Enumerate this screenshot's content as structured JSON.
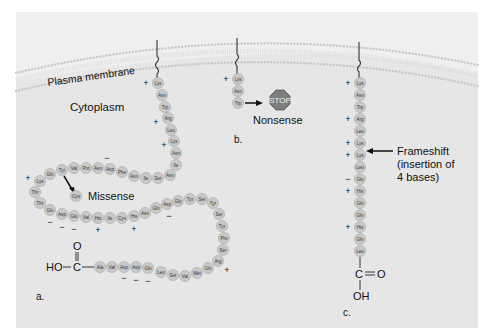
{
  "labels": {
    "membrane": "Plasma membrane",
    "cytoplasm": "Cytoplasm",
    "missense": "Missense",
    "nonsense": "Nonsense",
    "stop": "STOP",
    "frameshift_line1": "Frameshift",
    "frameshift_line2": "(insertion of",
    "frameshift_line3": "4 bases)",
    "panel_a": "a.",
    "panel_b": "b.",
    "panel_c": "c."
  },
  "chemistry": {
    "a_HO": "HO",
    "a_C": "C",
    "a_O": "O",
    "c_C": "C",
    "c_O": "O",
    "c_OH": "OH"
  },
  "colors": {
    "panel": "#e6e6e6",
    "amino_acid": "#c8c8c8",
    "stop_sign": "#7d7d7d"
  },
  "panel_a": {
    "residues": [
      {
        "aa": "Lys",
        "x": 158,
        "y": 83,
        "charge": "+",
        "cx": 146,
        "cy": 83
      },
      {
        "aa": "Asn",
        "x": 162,
        "y": 95
      },
      {
        "aa": "Trp",
        "x": 165,
        "y": 107
      },
      {
        "aa": "Arg",
        "x": 168,
        "y": 118,
        "charge": "+",
        "cx": 156,
        "cy": 122
      },
      {
        "aa": "Leu",
        "x": 171,
        "y": 130
      },
      {
        "aa": "Lys",
        "x": 174,
        "y": 141,
        "charge": "+",
        "cx": 164,
        "cy": 145
      },
      {
        "aa": "Asn",
        "x": 176,
        "y": 153
      },
      {
        "aa": "Ile",
        "x": 176,
        "y": 165
      },
      {
        "aa": "Asn",
        "x": 170,
        "y": 175
      },
      {
        "aa": "Ser",
        "x": 158,
        "y": 178
      },
      {
        "aa": "Ile",
        "x": 146,
        "y": 178
      },
      {
        "aa": "Asn",
        "x": 134,
        "y": 176
      },
      {
        "aa": "Phe",
        "x": 122,
        "y": 172
      },
      {
        "aa": "Asp",
        "x": 110,
        "y": 169,
        "charge": "−",
        "cx": 107,
        "cy": 158
      },
      {
        "aa": "Asn",
        "x": 98,
        "y": 168
      },
      {
        "aa": "Pro",
        "x": 86,
        "y": 168
      },
      {
        "aa": "Val",
        "x": 74,
        "y": 168
      },
      {
        "aa": "Tyr",
        "x": 62,
        "y": 170
      },
      {
        "aa": "Gln",
        "x": 50,
        "y": 174
      },
      {
        "aa": "Lys",
        "x": 40,
        "y": 181,
        "charge": "+",
        "cx": 28,
        "cy": 178
      },
      {
        "aa": "Thr",
        "x": 35,
        "y": 192
      },
      {
        "aa": "Thr",
        "x": 40,
        "y": 203
      },
      {
        "aa": "Glu",
        "x": 50,
        "y": 210,
        "charge": "−",
        "cx": 50,
        "cy": 222
      },
      {
        "aa": "Asp",
        "x": 62,
        "y": 214,
        "charge": "−",
        "cx": 62,
        "cy": 227
      },
      {
        "aa": "Glu",
        "x": 74,
        "y": 216,
        "charge": "−",
        "cx": 74,
        "cy": 229
      },
      {
        "aa": "Val",
        "x": 86,
        "y": 217
      },
      {
        "aa": "His",
        "x": 98,
        "y": 218,
        "charge": "+",
        "cx": 98,
        "cy": 230
      },
      {
        "aa": "Ile",
        "x": 110,
        "y": 218
      },
      {
        "aa": "Cys",
        "x": 122,
        "y": 218
      },
      {
        "aa": "His",
        "x": 134,
        "y": 216,
        "charge": "+",
        "cx": 134,
        "cy": 229
      },
      {
        "aa": "Asn",
        "x": 145,
        "y": 213
      },
      {
        "aa": "Gln",
        "x": 156,
        "y": 208
      },
      {
        "aa": "Asp",
        "x": 167,
        "y": 204,
        "charge": "−",
        "cx": 169,
        "cy": 216
      },
      {
        "aa": "Gly",
        "x": 178,
        "y": 201
      },
      {
        "aa": "Tyr",
        "x": 190,
        "y": 199
      },
      {
        "aa": "Ser",
        "x": 202,
        "y": 199
      },
      {
        "aa": "Tyr",
        "x": 213,
        "y": 203
      },
      {
        "aa": "Ser",
        "x": 219,
        "y": 214
      },
      {
        "aa": "Tyr",
        "x": 222,
        "y": 226
      },
      {
        "aa": "Pro",
        "x": 224,
        "y": 238
      },
      {
        "aa": "Ser",
        "x": 223,
        "y": 250
      },
      {
        "aa": "Arg",
        "x": 218,
        "y": 261,
        "charge": "+",
        "cx": 227,
        "cy": 270
      },
      {
        "aa": "Gln",
        "x": 208,
        "y": 268
      },
      {
        "aa": "Met",
        "x": 197,
        "y": 273
      },
      {
        "aa": "Val",
        "x": 185,
        "y": 276
      },
      {
        "aa": "Ser",
        "x": 173,
        "y": 275
      },
      {
        "aa": "Leu",
        "x": 161,
        "y": 272
      },
      {
        "aa": "Glu",
        "x": 148,
        "y": 268,
        "charge": "−",
        "cx": 148,
        "cy": 281
      },
      {
        "aa": "Asp",
        "x": 136,
        "y": 267,
        "charge": "−",
        "cx": 136,
        "cy": 280
      },
      {
        "aa": "Asp",
        "x": 124,
        "y": 267,
        "charge": "−",
        "cx": 124,
        "cy": 278
      },
      {
        "aa": "Val",
        "x": 112,
        "y": 267
      },
      {
        "aa": "Ala",
        "x": 100,
        "y": 267
      }
    ],
    "mutant": {
      "aa": "Cys",
      "x": 76,
      "y": 196
    }
  },
  "panel_b": {
    "residues": [
      {
        "aa": "Lys",
        "x": 238,
        "y": 79,
        "charge": "+",
        "cx": 226,
        "cy": 79
      },
      {
        "aa": "Asn",
        "x": 238,
        "y": 91
      },
      {
        "aa": "Trp",
        "x": 238,
        "y": 103
      }
    ]
  },
  "panel_c": {
    "residues": [
      {
        "aa": "Lys",
        "x": 360,
        "y": 83,
        "charge": "+",
        "cx": 348,
        "cy": 83
      },
      {
        "aa": "Asn",
        "x": 360,
        "y": 95
      },
      {
        "aa": "Trp",
        "x": 360,
        "y": 107
      },
      {
        "aa": "Arg",
        "x": 360,
        "y": 119,
        "charge": "+",
        "cx": 348,
        "cy": 119
      },
      {
        "aa": "Leu",
        "x": 360,
        "y": 131
      },
      {
        "aa": "Lys",
        "x": 360,
        "y": 143,
        "charge": "+",
        "cx": 348,
        "cy": 143
      },
      {
        "aa": "Lys",
        "x": 360,
        "y": 155,
        "charge": "+",
        "cx": 348,
        "cy": 155
      },
      {
        "aa": "Leu",
        "x": 360,
        "y": 167
      },
      {
        "aa": "Glu",
        "x": 360,
        "y": 179,
        "charge": "−",
        "cx": 348,
        "cy": 179
      },
      {
        "aa": "His",
        "x": 360,
        "y": 191,
        "charge": "+",
        "cx": 348,
        "cy": 191
      },
      {
        "aa": "Gln",
        "x": 360,
        "y": 203
      },
      {
        "aa": "Gln",
        "x": 360,
        "y": 215
      },
      {
        "aa": "His",
        "x": 360,
        "y": 227,
        "charge": "+",
        "cx": 348,
        "cy": 227
      },
      {
        "aa": "Gln",
        "x": 360,
        "y": 239
      },
      {
        "aa": "Leu",
        "x": 360,
        "y": 251
      }
    ]
  }
}
